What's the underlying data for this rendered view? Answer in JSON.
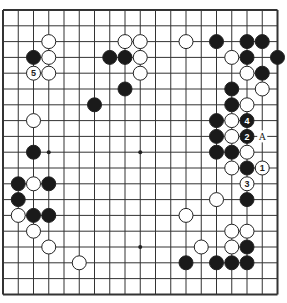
{
  "board": {
    "size": 19,
    "origin_x": 3,
    "origin_y": 10,
    "spacing_x": 15.25,
    "spacing_y": 15.8,
    "line_color": "#333333",
    "border_width": 2,
    "stone_radius": 7,
    "star_points": [
      [
        3,
        3
      ],
      [
        9,
        3
      ],
      [
        15,
        3
      ],
      [
        3,
        9
      ],
      [
        9,
        9
      ],
      [
        15,
        9
      ],
      [
        3,
        15
      ],
      [
        9,
        15
      ],
      [
        15,
        15
      ]
    ]
  },
  "stones": {
    "black": [
      [
        2,
        3
      ],
      [
        7,
        3
      ],
      [
        8,
        3
      ],
      [
        8,
        5
      ],
      [
        6,
        6
      ],
      [
        14,
        2
      ],
      [
        16,
        2
      ],
      [
        17,
        2
      ],
      [
        16,
        3
      ],
      [
        18,
        3
      ],
      [
        17,
        4
      ],
      [
        15,
        5
      ],
      [
        15,
        6
      ],
      [
        14,
        7
      ],
      [
        14,
        8
      ],
      [
        14,
        9
      ],
      [
        15,
        9
      ],
      [
        16,
        10
      ],
      [
        16,
        12
      ],
      [
        2,
        9
      ],
      [
        1,
        11
      ],
      [
        3,
        11
      ],
      [
        1,
        12
      ],
      [
        2,
        13
      ],
      [
        3,
        13
      ],
      [
        12,
        16
      ],
      [
        14,
        16
      ],
      [
        15,
        16
      ],
      [
        16,
        16
      ],
      [
        16,
        15
      ]
    ],
    "white": [
      [
        3,
        2
      ],
      [
        3,
        3
      ],
      [
        3,
        4
      ],
      [
        8,
        2
      ],
      [
        9,
        2
      ],
      [
        12,
        2
      ],
      [
        9,
        3
      ],
      [
        9,
        4
      ],
      [
        15,
        3
      ],
      [
        16,
        4
      ],
      [
        17,
        5
      ],
      [
        16,
        6
      ],
      [
        15,
        7
      ],
      [
        15,
        8
      ],
      [
        16,
        9
      ],
      [
        15,
        10
      ],
      [
        14,
        12
      ],
      [
        2,
        7
      ],
      [
        2,
        11
      ],
      [
        1,
        13
      ],
      [
        2,
        14
      ],
      [
        3,
        15
      ],
      [
        5,
        16
      ],
      [
        12,
        13
      ],
      [
        13,
        15
      ],
      [
        15,
        14
      ],
      [
        16,
        14
      ],
      [
        15,
        15
      ]
    ]
  },
  "numbered_moves": [
    {
      "number": "1",
      "color": "white",
      "col": 17,
      "row": 10
    },
    {
      "number": "2",
      "color": "black",
      "col": 16,
      "row": 8
    },
    {
      "number": "3",
      "color": "white",
      "col": 16,
      "row": 11
    },
    {
      "number": "4",
      "color": "black",
      "col": 16,
      "row": 7
    },
    {
      "number": "5",
      "color": "white",
      "col": 2,
      "row": 4
    }
  ],
  "marks": [
    {
      "label": "A",
      "col": 17,
      "row": 8
    }
  ]
}
